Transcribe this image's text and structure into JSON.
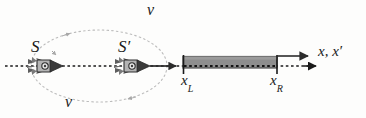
{
  "figure": {
    "type": "physics-diagram",
    "width": 366,
    "height": 118,
    "background_color": "#fdfdfc"
  },
  "labels": {
    "frame_S": "S",
    "frame_S_prime": "S′",
    "velocity_top": "v",
    "velocity_bottom": "v",
    "x_left": "x",
    "x_left_sub": "L",
    "x_right": "x",
    "x_right_sub": "R",
    "axis": "x, x′"
  },
  "elements": {
    "axis_line": {
      "name": "x-axis dotted line",
      "style": "dotted",
      "color": "#1a1a1a",
      "x_start": 5,
      "x_end": 316,
      "y": 66
    },
    "rod": {
      "name": "rod",
      "fill_color": "#8e8e8e",
      "border_color": "#4a4a4a",
      "x_left": 183,
      "x_right": 277,
      "y_top": 56,
      "y_bottom": 68
    },
    "ellipse": {
      "name": "velocity loop",
      "style": "dotted",
      "color": "#b9b9b9",
      "center_x": 99,
      "center_y": 66,
      "radius_x": 68,
      "radius_y": 36
    },
    "rocket_S": {
      "name": "rocket-S",
      "x": 48,
      "y": 66
    },
    "rocket_S_prime": {
      "name": "rocket-S-prime",
      "x": 135,
      "y": 66
    },
    "velocity_arrow": {
      "name": "S-prime velocity arrow",
      "x_start": 152,
      "x_end": 178,
      "y": 66,
      "color": "#2b2b2b"
    },
    "axis_solid_arrow": {
      "name": "x-axis solid arrow",
      "x_start": 277,
      "x_end": 312,
      "y": 56,
      "color": "#2b2b2b"
    },
    "tick_left": {
      "name": "tick-xL",
      "x": 183,
      "y_top": 56,
      "y_bottom": 74
    },
    "tick_right": {
      "name": "tick-xR",
      "x": 277,
      "y_top": 56,
      "y_bottom": 74
    }
  },
  "colors": {
    "ink": "#1a1a1a",
    "rod_fill": "#8e8e8e",
    "rod_stroke": "#4a4a4a",
    "ellipse": "#b9b9b9",
    "rocket_body": "#7d7d7d",
    "rocket_outline": "#2e2e2e",
    "paper": "#fdfdfc"
  }
}
